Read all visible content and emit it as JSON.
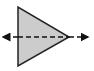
{
  "diagram": {
    "shape": "triangle",
    "direction": "right",
    "fill_color": "#cccccc",
    "stroke_color": "#222222",
    "axis": {
      "style": "dashed",
      "arrows": [
        "left",
        "right"
      ],
      "color": "#111111"
    }
  }
}
